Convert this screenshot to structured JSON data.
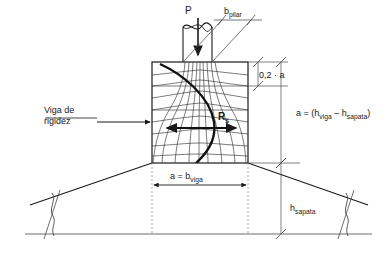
{
  "figure": {
    "kind": "engineering-diagram",
    "background_color": "#ffffff",
    "line_color": "#1a1a1a",
    "thin_line_color": "#4a4a4a",
    "ground_line_color": "#6e6e6e"
  },
  "labels": {
    "load": "P",
    "column_width": "b",
    "column_width_sub": "pilar",
    "top_band": "0,2 · a",
    "beam_name_line1": "Viga de",
    "beam_name_line2": "rigidez",
    "resultant": "R",
    "resultant_sub": "s",
    "height_relation_a": "a = (h",
    "height_relation_sub1": "viga",
    "height_relation_mid": " – h",
    "height_relation_sub2": "sapata",
    "height_relation_end": ")",
    "width_relation": "a = b",
    "width_relation_sub": "viga",
    "footing_height": "h",
    "footing_height_sub": "sapata"
  },
  "geometry": {
    "block_left": 152,
    "block_right": 248,
    "block_top": 62,
    "block_bottom": 163,
    "column_left": 183,
    "column_right": 212,
    "column_top": 22,
    "band_02a_y": 86,
    "ground_line_y": 234,
    "footing_left_x": 30,
    "footing_right_x": 368
  },
  "dimensions": [
    {
      "name": "b_pilar",
      "text": "b_pilar",
      "orientation": "diagonal-top"
    },
    {
      "name": "0,2a",
      "text": "0,2 · a",
      "orientation": "vertical-right"
    },
    {
      "name": "a_height",
      "text": "a = (h_viga – h_sapata)",
      "orientation": "vertical-right"
    },
    {
      "name": "a_width",
      "text": "a = b_viga",
      "orientation": "horizontal-bottom"
    },
    {
      "name": "h_sapata",
      "text": "h_sapata",
      "orientation": "vertical-right"
    }
  ]
}
